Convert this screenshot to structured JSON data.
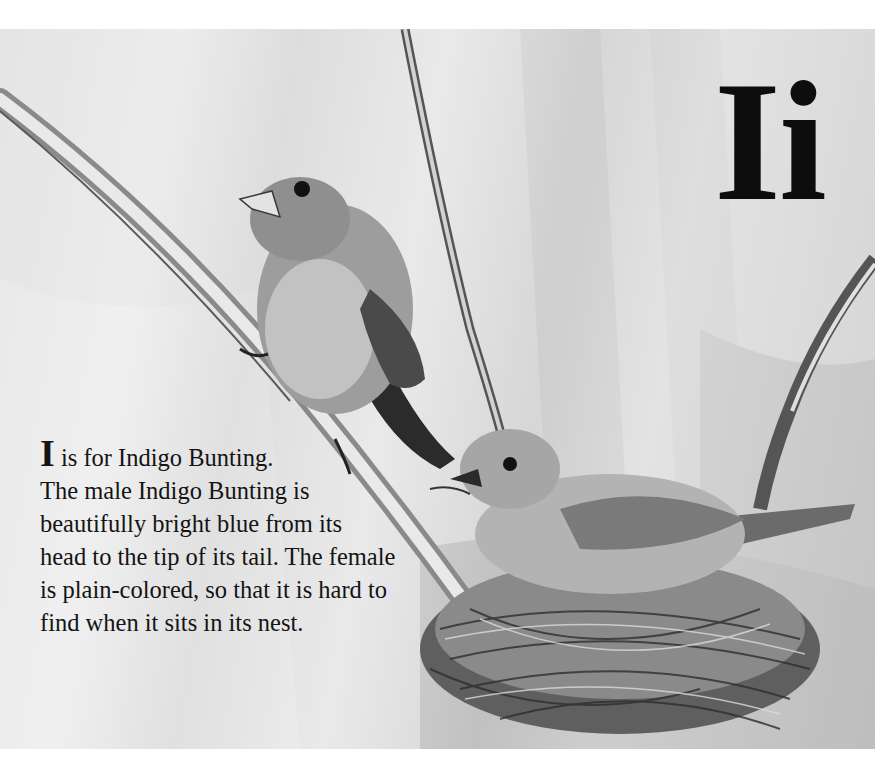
{
  "page": {
    "letter_heading": "Ii",
    "caption": {
      "initial": "I",
      "first_line_rest": " is for Indigo Bunting.",
      "lines": [
        "The male Indigo Bunting is",
        "beautifully bright blue from its",
        "head to the tip of its tail. The female",
        "is plain-colored, so that it is hard to",
        "find when it sits in its nest."
      ]
    },
    "illustration": {
      "subject": "Two Indigo Buntings: male perched on a reed stem, female sitting in a grass nest",
      "palette": {
        "background": "#dcdcdc",
        "reed": "#b8b8b8",
        "dark": "#2a2a2a",
        "nest": "#7a7a7a"
      }
    }
  }
}
